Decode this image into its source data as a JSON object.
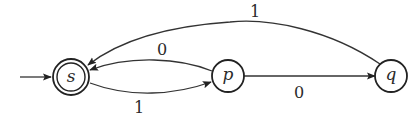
{
  "diagram": {
    "type": "finite-automaton",
    "start_state": "s",
    "accepting_states": [
      "s"
    ],
    "states": [
      {
        "id": "s",
        "label": "s",
        "accepting": true,
        "start": true
      },
      {
        "id": "p",
        "label": "p",
        "accepting": false,
        "start": false
      },
      {
        "id": "q",
        "label": "q",
        "accepting": false,
        "start": false
      }
    ],
    "transitions": [
      {
        "from": "s",
        "to": "p",
        "label": "1"
      },
      {
        "from": "p",
        "to": "s",
        "label": "0"
      },
      {
        "from": "p",
        "to": "q",
        "label": "0"
      },
      {
        "from": "q",
        "to": "s",
        "label": "1"
      }
    ]
  }
}
